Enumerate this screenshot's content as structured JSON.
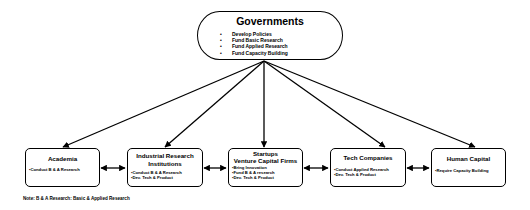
{
  "diagram": {
    "root": {
      "title": "Governments",
      "items": [
        "Develop Policies",
        "Fund Basic Research",
        "Fund Applied Research",
        "Fund Capacity Building"
      ]
    },
    "nodes": [
      {
        "title": "Academia",
        "items": [
          "Conduct B & A  Research"
        ]
      },
      {
        "title": "Industrial Research Institutions",
        "items": [
          "Conduct B & A  Research",
          "Dev. Tech & Product"
        ]
      },
      {
        "title": "Startups\nVenture Capital Firms",
        "title_line1": "Startups",
        "title_line2": "Venture Capital Firms",
        "items": [
          "Bring Innovation",
          "Fund B & A research",
          "Dev. Tech & Product"
        ]
      },
      {
        "title": "Tech Companies",
        "items": [
          "Conduct Applied Research",
          "Dev. Tech & Product"
        ]
      },
      {
        "title": "Human Capital",
        "items": [
          "Require Capacity Building"
        ]
      }
    ],
    "edges": [
      {
        "from": "Governments",
        "to": "Academia",
        "type": "directed"
      },
      {
        "from": "Governments",
        "to": "Industrial Research Institutions",
        "type": "directed"
      },
      {
        "from": "Governments",
        "to": "Startups Venture Capital Firms",
        "type": "directed"
      },
      {
        "from": "Governments",
        "to": "Tech Companies",
        "type": "directed"
      },
      {
        "from": "Governments",
        "to": "Human Capital",
        "type": "directed"
      },
      {
        "from": "Academia",
        "to": "Industrial Research Institutions",
        "type": "bidirectional"
      },
      {
        "from": "Industrial Research Institutions",
        "to": "Startups Venture Capital Firms",
        "type": "bidirectional"
      },
      {
        "from": "Startups Venture Capital Firms",
        "to": "Tech Companies",
        "type": "bidirectional"
      },
      {
        "from": "Tech Companies",
        "to": "Human Capital",
        "type": "bidirectional"
      }
    ],
    "note": "Note: B & A Research: Basic & Applied Research"
  }
}
